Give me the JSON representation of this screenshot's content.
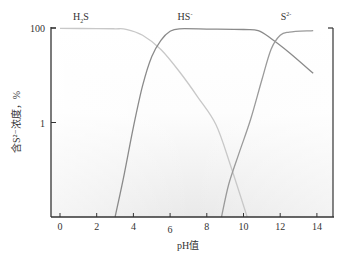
{
  "chart_data": {
    "type": "line",
    "title": "",
    "xlabel": "pH值",
    "ylabel": "含S²⁻浓度，%",
    "x_ticks": [
      0,
      2,
      4,
      6,
      8,
      10,
      12,
      14
    ],
    "y_ticks": [
      {
        "value": 100,
        "label": "100"
      },
      {
        "value": 1,
        "label": "1"
      }
    ],
    "y_scale": "log",
    "xlim": [
      -0.5,
      15
    ],
    "ylim": [
      0.01,
      100
    ],
    "grid": false,
    "legend": "inline labels at top",
    "series": [
      {
        "name": "H₂S",
        "label_main": "H",
        "label_sub": "2",
        "label_tail": "S",
        "color": "#c8c8c8",
        "x": [
          0,
          2,
          3,
          3.6,
          4.5,
          5.5,
          6.5,
          7.5,
          8.5,
          9.3,
          10.2
        ],
        "y": [
          98,
          97,
          96,
          94,
          70,
          35,
          12,
          3.5,
          0.9,
          0.12,
          0.01
        ]
      },
      {
        "name": "HS⁻",
        "label_main": "HS",
        "label_sup": "-",
        "color": "#8a8a8a",
        "x": [
          3.0,
          3.5,
          4.0,
          4.5,
          5.0,
          5.5,
          6.0,
          6.5,
          8,
          10,
          10.8,
          11.5,
          12.5,
          13.8
        ],
        "y": [
          0.01,
          0.08,
          0.8,
          6,
          25,
          55,
          85,
          96,
          95,
          93,
          88,
          60,
          30,
          11
        ]
      },
      {
        "name": "S²⁻",
        "label_main": "S",
        "label_sup": "2-",
        "color": "#9a9a9a",
        "x": [
          8.8,
          9.2,
          9.8,
          10.4,
          11.0,
          11.5,
          12.0,
          12.5,
          13.8
        ],
        "y": [
          0.01,
          0.05,
          0.25,
          1.2,
          8,
          35,
          70,
          82,
          88
        ]
      }
    ]
  },
  "labels": {
    "xlabel": "pH值",
    "ylabel": "含S²⁻浓度，%",
    "species": [
      "H₂S",
      "HS⁻",
      "S²⁻"
    ]
  }
}
